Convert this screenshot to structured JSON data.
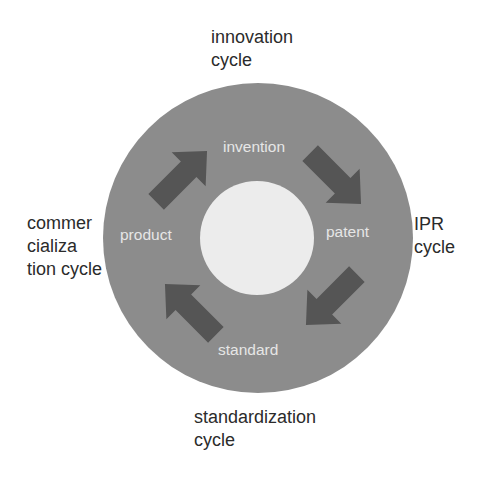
{
  "diagram": {
    "type": "cycle",
    "colors": {
      "background": "#ffffff",
      "outer_ring": "#8c8c8c",
      "inner_circle": "#ececec",
      "arrow": "#555555",
      "node_text": "#e6e6e6",
      "outer_text": "#2b2b2b"
    },
    "nodes": [
      {
        "id": "invention",
        "label": "invention"
      },
      {
        "id": "patent",
        "label": "patent"
      },
      {
        "id": "standard",
        "label": "standard"
      },
      {
        "id": "product",
        "label": "product"
      }
    ],
    "edges": [
      {
        "from": "invention",
        "to": "patent",
        "arrow": "down-right"
      },
      {
        "from": "patent",
        "to": "standard",
        "arrow": "down-left"
      },
      {
        "from": "standard",
        "to": "product",
        "arrow": "up-left"
      },
      {
        "from": "product",
        "to": "invention",
        "arrow": "up-right"
      }
    ],
    "cycle_labels": {
      "innovation": "innovation\ncycle",
      "ipr": "IPR\ncycle",
      "standardization": "standardization\ncycle",
      "commercialization": "commer\ncializa\ntion cycle"
    }
  }
}
